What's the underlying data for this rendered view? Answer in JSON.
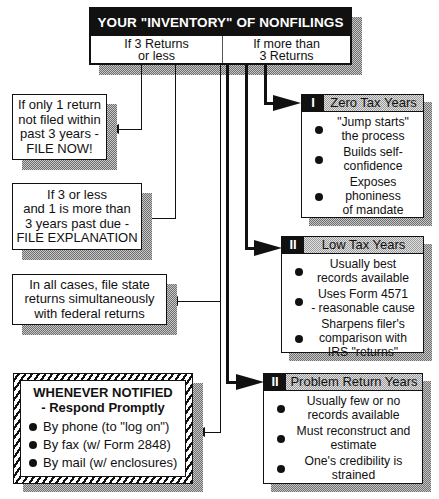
{
  "header": {
    "title": "YOUR \"INVENTORY\" OF NONFILINGS",
    "left_col": [
      "If 3 Returns",
      "or less"
    ],
    "right_col": [
      "If more than",
      "3 Returns"
    ]
  },
  "left_boxes": [
    {
      "lines": [
        "If only 1 return",
        "not filed within",
        "past 3 years -",
        "FILE NOW!"
      ]
    },
    {
      "lines": [
        "If 3 or less",
        "and 1 is more than",
        "3 years past due -",
        "FILE EXPLANATION"
      ]
    },
    {
      "lines": [
        "In all cases, file state",
        "returns simultaneously",
        "with federal returns"
      ]
    }
  ],
  "notice": {
    "title": "WHENEVER NOTIFIED",
    "subtitle": "- Respond Promptly",
    "items": [
      "By phone (to \"log on\")",
      "By fax (w/ Form 2848)",
      "By mail (w/ enclosures)"
    ]
  },
  "categories": [
    {
      "numeral": "I",
      "title": "Zero Tax Years",
      "items": [
        [
          "\"Jump starts\"",
          "the process"
        ],
        [
          "Builds self-",
          "confidence"
        ],
        [
          "Exposes",
          "phoniness",
          "of mandate"
        ]
      ]
    },
    {
      "numeral": "II",
      "title": "Low Tax Years",
      "items": [
        [
          "Usually best",
          "records available"
        ],
        [
          "Uses Form 4571",
          "- reasonable cause"
        ],
        [
          "Sharpens filer's",
          "comparison with",
          "IRS \"returns\""
        ]
      ]
    },
    {
      "numeral": "II",
      "title": "Problem Return Years",
      "items": [
        [
          "Usually few or no",
          "records available"
        ],
        [
          "Must reconstruct and",
          "estimate"
        ],
        [
          "One's credibility is",
          "strained"
        ]
      ]
    }
  ],
  "colors": {
    "ink": "#111111",
    "shadow": "#9a9a9a",
    "paper": "#ffffff"
  }
}
